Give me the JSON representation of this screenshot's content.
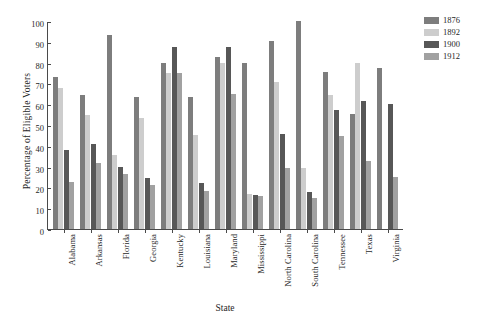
{
  "chart_data": {
    "type": "bar",
    "title": "",
    "xlabel": "State",
    "ylabel": "Percentage of Eligible Voters",
    "ylim": [
      0,
      100
    ],
    "ytick_values": [
      100,
      90,
      80,
      70,
      60,
      50,
      40,
      30,
      20,
      10,
      0
    ],
    "ytick_labels": [
      "100",
      "90",
      "80",
      "70",
      "60",
      "50",
      "40",
      "30",
      "20",
      "10",
      "0"
    ],
    "grid": false,
    "legend_position": "top-right",
    "categories": [
      "Alabama",
      "Arkansas",
      "Florida",
      "Georgia",
      "Kentucky",
      "Louisiana",
      "Maryland",
      "Mississippi",
      "North Carolina",
      "South Carolina",
      "Tennessee",
      "Texas",
      "Virginia"
    ],
    "series": [
      {
        "name": "1876",
        "color": "#7d7d7d",
        "values": [
          73,
          64.5,
          93.5,
          63.5,
          80,
          63.5,
          82.5,
          80,
          90.5,
          100,
          75.5,
          55.5,
          77.5
        ]
      },
      {
        "name": "1892",
        "color": "#cdcdcd",
        "values": [
          68,
          55,
          35.5,
          53.5,
          75,
          45,
          80,
          17,
          70.5,
          29.5,
          64.5,
          80,
          0
        ]
      },
      {
        "name": "1900",
        "color": "#575757",
        "values": [
          38,
          41,
          30,
          24.5,
          87.5,
          22,
          87.5,
          16.5,
          45.5,
          18,
          57,
          61.5,
          60
        ]
      },
      {
        "name": "1912",
        "color": "#a1a1a1",
        "values": [
          22.5,
          31.5,
          26.5,
          21,
          75,
          18.5,
          65,
          16,
          29.5,
          15,
          44.5,
          32.5,
          25
        ]
      }
    ]
  },
  "legend": {
    "entries": [
      {
        "label": "1876",
        "color": "#7d7d7d"
      },
      {
        "label": "1892",
        "color": "#cdcdcd"
      },
      {
        "label": "1900",
        "color": "#575757"
      },
      {
        "label": "1912",
        "color": "#a1a1a1"
      }
    ]
  }
}
